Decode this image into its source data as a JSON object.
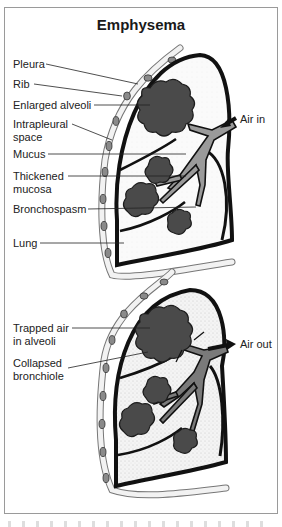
{
  "title": "Emphysema",
  "panels": [
    {
      "name": "inhalation",
      "airflow_label": "Air in",
      "labels": [
        {
          "text": "Pleura"
        },
        {
          "text": "Rib"
        },
        {
          "text": "Enlarged alveoli"
        },
        {
          "text": "Intrapleural space"
        },
        {
          "text": "Mucus"
        },
        {
          "text": "Thickened mucosa"
        },
        {
          "text": "Bronchospasm"
        },
        {
          "text": "Lung"
        }
      ]
    },
    {
      "name": "exhalation",
      "airflow_label": "Air out",
      "labels": [
        {
          "text": "Trapped air in alveoli"
        },
        {
          "text": "Collapsed bronchiole"
        }
      ]
    }
  ],
  "label_lines": {
    "pleura": "Pleura",
    "rib": "Rib",
    "enlarged_alveoli": "Enlarged alveoli",
    "intrapleural_1": "Intrapleural",
    "intrapleural_2": "space",
    "mucus": "Mucus",
    "thickened_1": "Thickened",
    "thickened_2": "mucosa",
    "bronchospasm": "Bronchospasm",
    "lung": "Lung",
    "air_in": "Air in",
    "trapped_1": "Trapped air",
    "trapped_2": "in alveoli",
    "collapsed_1": "Collapsed",
    "collapsed_2": "bronchiole",
    "air_out": "Air out"
  },
  "colors": {
    "outline": "#111111",
    "alveoli": "#4a4a4a",
    "bronchi": "#8c8c8c",
    "rib": "#8a8a8a",
    "stipple": "#cfcfcf"
  }
}
